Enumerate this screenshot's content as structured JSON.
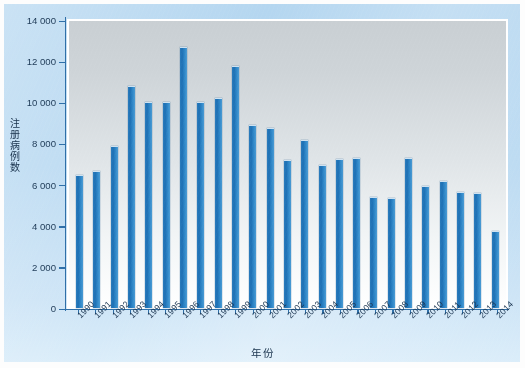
{
  "chart_data": {
    "type": "bar",
    "title": "",
    "xlabel": "年份",
    "ylabel": "注册病例数",
    "ylim": [
      0,
      14000
    ],
    "ytick_step": 2000,
    "ytick_labels": [
      "14 000",
      "12 000",
      "10 000",
      "8 000",
      "6 000",
      "4 000",
      "2 000",
      "0"
    ],
    "ytick_values": [
      14000,
      12000,
      10000,
      8000,
      6000,
      4000,
      2000,
      0
    ],
    "grid": false,
    "legend": "none",
    "bar_color": "#2176bd",
    "plot_background": "#dfe4e7",
    "figure_background": "#b5d7f0",
    "categories": [
      "1990",
      "1991",
      "1992",
      "1993",
      "1994",
      "1995",
      "1996",
      "1997",
      "1998",
      "1999",
      "2000",
      "2001",
      "2002",
      "2003",
      "2004",
      "2005",
      "2006",
      "2007",
      "2008",
      "2009",
      "2010",
      "2011",
      "2012",
      "2013",
      "2014"
    ],
    "values": [
      6500,
      6700,
      7950,
      10900,
      10100,
      10100,
      12800,
      10100,
      10300,
      11900,
      8950,
      8800,
      7250,
      8250,
      7000,
      7300,
      7350,
      5400,
      5350,
      7350,
      5950,
      6200,
      5650,
      5600,
      3750
    ]
  }
}
